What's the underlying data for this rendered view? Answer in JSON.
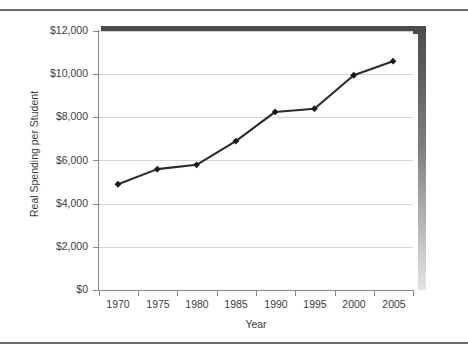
{
  "chart_data": {
    "type": "line",
    "title": "",
    "subtitle": "",
    "xlabel": "Year",
    "ylabel": "Real Spending per Student",
    "x": [
      1970,
      1975,
      1980,
      1985,
      1990,
      1995,
      2000,
      2005
    ],
    "categories": [
      "1970",
      "1975",
      "1980",
      "1985",
      "1990",
      "1995",
      "2000",
      "2005"
    ],
    "values": [
      4900,
      5600,
      5800,
      6900,
      8250,
      8400,
      9950,
      10600
    ],
    "series": [
      {
        "name": "Real Spending per Student",
        "values": [
          4900,
          5600,
          5800,
          6900,
          8250,
          8400,
          9950,
          10600
        ]
      }
    ],
    "xlim": [
      1967.5,
      2007.5
    ],
    "ylim": [
      0,
      12000
    ],
    "ytick_values": [
      0,
      2000,
      4000,
      6000,
      8000,
      10000,
      12000
    ],
    "ytick_labels": [
      "$0",
      "$2,000",
      "$4,000",
      "$6,000",
      "$8,000",
      "$10,000",
      "$12,000"
    ],
    "xtick_labels": [
      "1970",
      "1975",
      "1980",
      "1985",
      "1990",
      "1995",
      "2000",
      "2005"
    ],
    "grid": "horizontal",
    "legend": "none",
    "marker": "diamond",
    "line_color": "#2b2b2b",
    "marker_color": "#1a1a1a",
    "grid_color": "#d4d4d4",
    "axis_color": "#8a8a8a",
    "text_color": "#3b3b3b",
    "shadow_color": "#4a4a4a"
  },
  "figure": {
    "top_rule_color": "#6b6d70",
    "bottom_rule_color": "#6b6d70",
    "background": "#ffffff"
  }
}
